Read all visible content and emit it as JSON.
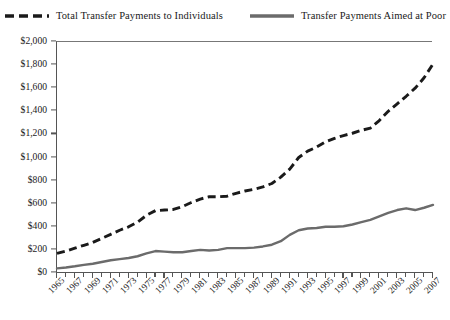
{
  "legend": {
    "position": "top-center",
    "items": [
      {
        "label": "Total Transfer Payments to Individuals",
        "style": "dashed",
        "color": "#1a1a1a",
        "icon": "dashed-line-swatch"
      },
      {
        "label": "Transfer Payments Aimed at Poor",
        "style": "solid",
        "color": "#6b6b6b",
        "icon": "solid-line-swatch"
      }
    ]
  },
  "axes": {
    "y": {
      "ticks": [
        "$0",
        "$200",
        "$400",
        "$600",
        "$800",
        "$1,000",
        "$1,200",
        "$1,400",
        "$1,600",
        "$1,800",
        "$2,000"
      ],
      "min": 0,
      "max": 2000,
      "step": 200
    },
    "x": {
      "min": 1965,
      "max": 2007,
      "labeled_step": 2,
      "ticks": [
        "1965",
        "1967",
        "1969",
        "1971",
        "1973",
        "1975",
        "1977",
        "1979",
        "1981",
        "1983",
        "1985",
        "1987",
        "1989",
        "1991",
        "1993",
        "1995",
        "1997",
        "1999",
        "2001",
        "2003",
        "2005",
        "2007"
      ]
    }
  },
  "colors": {
    "total_series": "#1a1a1a",
    "poor_series": "#6b6b6b",
    "axis": "#555555",
    "background": "#ffffff"
  },
  "chart_data": {
    "type": "line",
    "title": "",
    "subtitle": "",
    "xlabel": "",
    "ylabel": "",
    "xlim": [
      1965,
      2007
    ],
    "ylim": [
      0,
      2000
    ],
    "grid": false,
    "legend_position": "top-center",
    "value_unit": "billions of dollars",
    "x": [
      1965,
      1966,
      1967,
      1968,
      1969,
      1970,
      1971,
      1972,
      1973,
      1974,
      1975,
      1976,
      1977,
      1978,
      1979,
      1980,
      1981,
      1982,
      1983,
      1984,
      1985,
      1986,
      1987,
      1988,
      1989,
      1990,
      1991,
      1992,
      1993,
      1994,
      1995,
      1996,
      1997,
      1998,
      1999,
      2000,
      2001,
      2002,
      2003,
      2004,
      2005,
      2006,
      2007
    ],
    "series": [
      {
        "name": "Total Transfer Payments to Individuals",
        "style": "dashed",
        "color": "#1a1a1a",
        "values": [
          170,
          190,
          215,
          240,
          265,
          300,
          335,
          370,
          400,
          440,
          500,
          540,
          545,
          550,
          575,
          610,
          640,
          660,
          660,
          665,
          690,
          710,
          725,
          745,
          775,
          830,
          900,
          1000,
          1055,
          1090,
          1135,
          1165,
          1190,
          1210,
          1235,
          1255,
          1320,
          1400,
          1465,
          1530,
          1600,
          1690,
          1810
        ]
      },
      {
        "name": "Transfer Payments Aimed at Poor",
        "style": "solid",
        "color": "#6b6b6b",
        "values": [
          40,
          48,
          58,
          70,
          80,
          95,
          110,
          120,
          130,
          145,
          170,
          190,
          185,
          180,
          180,
          190,
          200,
          195,
          200,
          215,
          215,
          215,
          220,
          230,
          245,
          275,
          330,
          370,
          385,
          390,
          400,
          400,
          405,
          420,
          440,
          460,
          490,
          520,
          545,
          560,
          545,
          565,
          590
        ]
      }
    ]
  }
}
